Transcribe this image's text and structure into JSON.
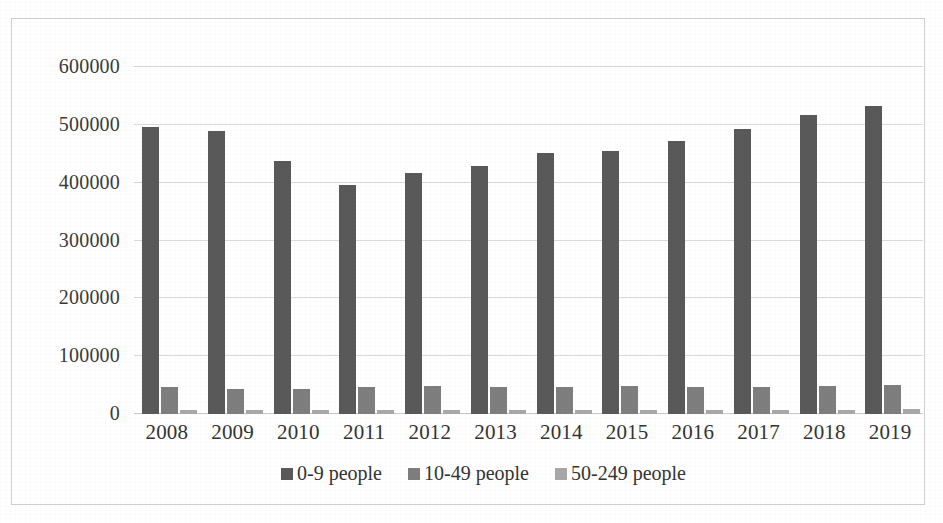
{
  "chart_data": {
    "type": "bar",
    "title": "",
    "subtitle": "",
    "xlabel": "",
    "ylabel": "",
    "categories": [
      "2008",
      "2009",
      "2010",
      "2011",
      "2012",
      "2013",
      "2014",
      "2015",
      "2016",
      "2017",
      "2018",
      "2019"
    ],
    "series": [
      {
        "name": "0-9 people",
        "color": "#595959",
        "values": [
          497000,
          489000,
          438000,
          396000,
          416000,
          428000,
          452000,
          455000,
          472000,
          493000,
          517000,
          532000
        ]
      },
      {
        "name": "10-49 people",
        "color": "#7e7e7e",
        "values": [
          47000,
          43000,
          43000,
          47000,
          48000,
          47000,
          47000,
          48000,
          46000,
          47000,
          48000,
          50000
        ]
      },
      {
        "name": "50-249 people",
        "color": "#a8a8a8",
        "values": [
          7000,
          6500,
          6500,
          7000,
          7000,
          7000,
          7000,
          7500,
          7000,
          7500,
          7500,
          8000
        ]
      }
    ],
    "ylim": [
      0,
      600000
    ],
    "yticks": [
      0,
      100000,
      200000,
      300000,
      400000,
      500000,
      600000
    ],
    "ytick_labels": [
      "0",
      "100000",
      "200000",
      "300000",
      "400000",
      "500000",
      "600000"
    ],
    "grid": true,
    "legend_position": "bottom"
  }
}
